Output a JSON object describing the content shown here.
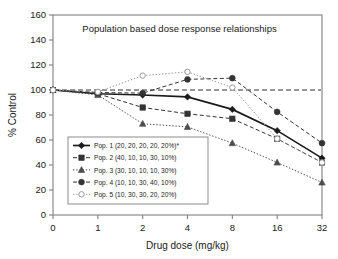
{
  "chart_data": {
    "type": "line",
    "title": "Population based dose response relationships",
    "xlabel": "Drug dose (mg/kg)",
    "ylabel": "% Control",
    "x": [
      0,
      1,
      2,
      4,
      8,
      16,
      32
    ],
    "xtick_labels": [
      "0",
      "1",
      "2",
      "4",
      "8",
      "16",
      "32"
    ],
    "ytick_labels": [
      "0",
      "20",
      "40",
      "60",
      "80",
      "100",
      "120",
      "140",
      "160"
    ],
    "ylim": [
      0,
      160
    ],
    "ytick_step": 20,
    "grid": false,
    "legend_position": "lower-left-inside",
    "reference_line": {
      "value": 100,
      "style": "dashed",
      "label": ""
    },
    "series": [
      {
        "name": "Pop. 1 (20, 20, 20, 20, 20%)*",
        "marker": "diamond",
        "line": "solid",
        "values": [
          100,
          97,
          96,
          94.5,
          84.5,
          67.5,
          45.5
        ]
      },
      {
        "name": "Pop. 2 (40, 10, 10, 30, 10%)",
        "marker": "square",
        "line": "dashed",
        "values": [
          100,
          97,
          86,
          81,
          77,
          61,
          42
        ]
      },
      {
        "name": "Pop. 3 (30, 10, 10, 10, 30%)",
        "marker": "triangle",
        "line": "dotted",
        "values": [
          100,
          96,
          73,
          70.5,
          57.5,
          42,
          26
        ]
      },
      {
        "name": "Pop. 4 (10, 10, 30, 40, 10%)",
        "marker": "circle",
        "line": "dashed",
        "values": [
          100,
          98,
          97.5,
          108.5,
          109.5,
          82.5,
          57.5
        ]
      },
      {
        "name": "Pop. 5 (10, 30, 30, 20, 20%)",
        "marker": "circle-open",
        "line": "dotted",
        "values": [
          100,
          98.5,
          111.5,
          114.5,
          102,
          61,
          42
        ]
      }
    ]
  },
  "colors": {
    "axis": "#808080",
    "ink": "#1a1a1a",
    "series1": "#1a1a1a",
    "series2": "#333333",
    "series3": "#4d4d4d",
    "series4": "#333333",
    "series5": "#999999"
  }
}
